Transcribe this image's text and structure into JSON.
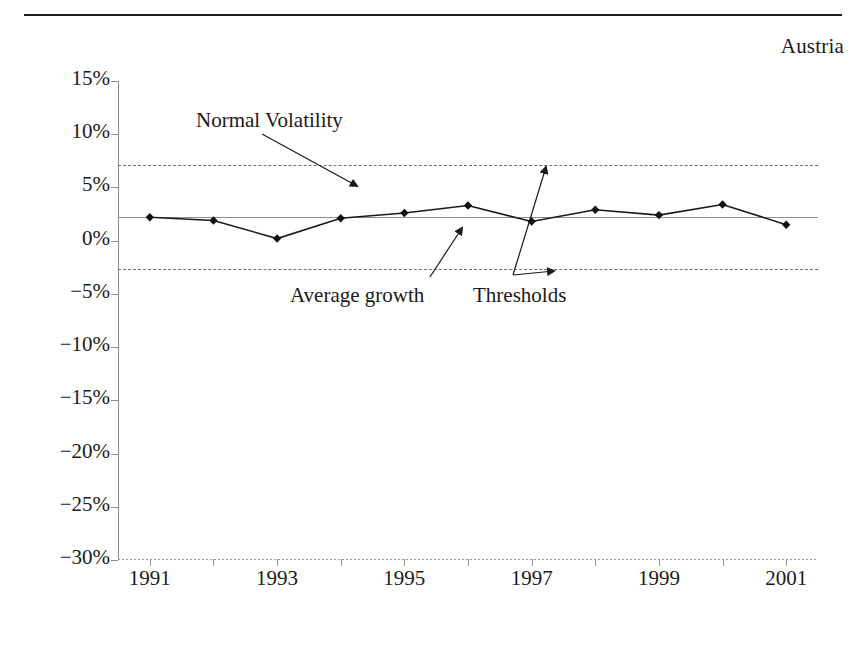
{
  "header": {
    "country_label": "Austria",
    "divider": "top-rule"
  },
  "chart_data": {
    "type": "line",
    "title": "",
    "subtitle": "",
    "xlabel": "",
    "ylabel": "",
    "x": [
      1991,
      1992,
      1993,
      1994,
      1995,
      1996,
      1997,
      1998,
      1999,
      2000,
      2001
    ],
    "values": [
      2.2,
      1.9,
      0.2,
      2.1,
      2.6,
      3.3,
      1.8,
      2.9,
      2.4,
      3.4,
      1.5
    ],
    "series": [
      {
        "name": "Real GDP growth",
        "values": [
          2.2,
          1.9,
          0.2,
          2.1,
          2.6,
          3.3,
          1.8,
          2.9,
          2.4,
          3.4,
          1.5
        ]
      }
    ],
    "reference_lines": [
      {
        "name": "Average growth",
        "value": 2.2,
        "style": "solid"
      },
      {
        "name": "Upper threshold",
        "value": 7.1,
        "style": "dashed"
      },
      {
        "name": "Lower threshold",
        "value": -2.7,
        "style": "dashed"
      }
    ],
    "ylim": [
      -30,
      15
    ],
    "ytick_values": [
      15,
      10,
      5,
      0,
      -5,
      -10,
      -15,
      -20,
      -25,
      -30
    ],
    "ytick_labels": [
      "15%",
      "10%",
      "5%",
      "0%",
      "−5%",
      "−10%",
      "−15%",
      "−20%",
      "−25%",
      "−30%"
    ],
    "xlim": [
      1990.5,
      2001.5
    ],
    "xtick_values": [
      1991,
      1992,
      1993,
      1994,
      1995,
      1996,
      1997,
      1998,
      1999,
      2000,
      2001
    ],
    "xtick_labels": [
      "1991",
      "",
      "1993",
      "",
      "1995",
      "",
      "1997",
      "",
      "1999",
      "",
      "2001"
    ],
    "xtick_labels_shown": [
      "1991",
      "1993",
      "1995",
      "1997",
      "1999",
      "2001"
    ],
    "grid": false,
    "legend": "none",
    "marker": "diamond",
    "annotations": [
      {
        "text": "Normal Volatility",
        "points_to": "upper-threshold-band"
      },
      {
        "text": "Average growth",
        "points_to": "average-growth-line"
      },
      {
        "text": "Thresholds",
        "points_to": "threshold-lines"
      }
    ],
    "colors": {
      "series_line": "#1a1a1a",
      "marker": "#111111",
      "average_line": "#8f8f8f",
      "threshold_line": "#6e6e6e",
      "axis": "#8a8a8a"
    }
  },
  "annotations": {
    "normal_volatility": "Normal Volatility",
    "average_growth": "Average growth",
    "thresholds": "Thresholds"
  }
}
